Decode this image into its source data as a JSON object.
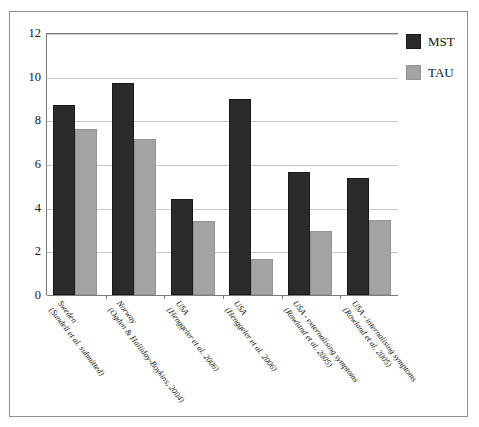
{
  "figure": {
    "top_caption_fragment": "",
    "frame_border_color": "#8d8d9c"
  },
  "legend": {
    "position": "right",
    "entries": [
      {
        "label": "MST",
        "color": "#2b2b2b",
        "swatch_name": "mst-swatch"
      },
      {
        "label": "TAU",
        "color": "#a3a3a3",
        "swatch_name": "tau-swatch"
      }
    ]
  },
  "chart_data": {
    "type": "bar",
    "title": "",
    "xlabel": "",
    "ylabel": "",
    "ylim": [
      0,
      12
    ],
    "yticks": [
      0,
      2,
      4,
      6,
      8,
      10,
      12
    ],
    "ytick_labels": [
      "0",
      "2",
      "4",
      "6",
      "8",
      "10",
      "12"
    ],
    "grid": true,
    "grid_axis": "y",
    "legend_position": "right",
    "categories": [
      "Sweden (Sundell et al. submitted)",
      "Norway (Ogden & Halliday-Boykins, 2004)",
      "USA (Henggeler et al. 2006)",
      "USA (Henggeler et al. 2006)",
      "USA - externalising symptoms (Rowland et al. 2005)",
      "USA - internalising symptoms (Rowland et al. 2005)"
    ],
    "category_lines": [
      {
        "line1": "Sweden",
        "line2": "(Sundell et al. submitted)"
      },
      {
        "line1": "Norway",
        "line2": "(Ogden & Halliday-Boykins, 2004)"
      },
      {
        "line1": "USA",
        "line2": "(Henggeler et al. 2006)"
      },
      {
        "line1": "USA",
        "line2": "(Henggeler et al. 2006)"
      },
      {
        "line1": "USA - externalising symptoms",
        "line2": "(Rowland et al. 2005)"
      },
      {
        "line1": "USA - internalising symptoms",
        "line2": "(Rowland et al. 2005)"
      }
    ],
    "series": [
      {
        "name": "MST",
        "color": "#2b2b2b",
        "values": [
          8.7,
          9.7,
          4.4,
          9.0,
          5.65,
          5.35
        ]
      },
      {
        "name": "TAU",
        "color": "#a3a3a3",
        "values": [
          7.6,
          7.15,
          3.4,
          1.65,
          2.95,
          3.45
        ]
      }
    ]
  }
}
